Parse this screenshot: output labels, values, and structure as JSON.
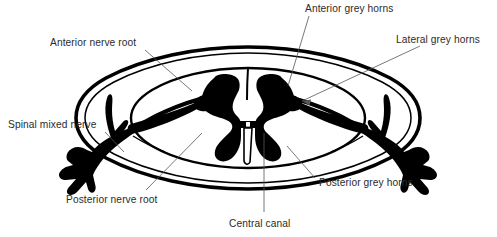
{
  "figure": {
    "background_color": "#ffffff",
    "ink_color": "#000000",
    "label_color": "#2b2b2b",
    "leader_color": "#555555",
    "width": 497,
    "height": 237
  },
  "labels": {
    "anterior_grey_horns": "Anterior grey horns",
    "lateral_grey_horns": "Lateral grey horns",
    "anterior_nerve_root": "Anterior nerve root",
    "spinal_mixed_nerve": "Spinal mixed nerve",
    "posterior_nerve_root": "Posterior nerve root",
    "posterior_grey_horns": "Posterior grey horns",
    "central_canal": "Central canal"
  },
  "structures": {
    "meninges": "double-line oval outer sheath",
    "cord_outline": "inner spinal cord ellipse",
    "grey_matter": "butterfly shaped grey matter",
    "central_canal": "central canal slit",
    "nerve_roots_left": "branching left spinal nerve",
    "nerve_roots_right": "branching right spinal nerve"
  }
}
